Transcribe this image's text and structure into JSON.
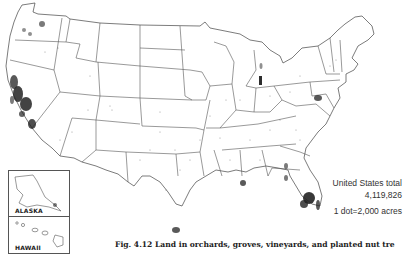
{
  "map": {
    "subject": "Land in orchards, groves, vineyards, and planted nut trees",
    "region": "United States",
    "symbology": "dot-density",
    "dot_color": "#222222",
    "boundary_color": "#555555",
    "background_color": "#ffffff",
    "concentrations": [
      "California Central Valley",
      "Southern California",
      "Washington (Yakima/Wenatchee)",
      "Oregon (Willamette/Hood River)",
      "Western Michigan",
      "Lake Erie shore / New York",
      "Mid-Atlantic (Virginia/Maryland/Pennsylvania)",
      "Georgia",
      "Central Florida",
      "Lower Rio Grande Valley, Texas",
      "Gulf Coast Mississippi/Alabama"
    ]
  },
  "legend": {
    "title": "United States total",
    "total": "4,119,826",
    "scale": "1 dot=2,000 acres"
  },
  "insets": {
    "alaska": {
      "label": "ALASKA"
    },
    "hawaii": {
      "label": "HAWAII"
    }
  },
  "caption": {
    "text": "Fig. 4.12   Land in orchards, groves, vineyards, and planted nut tre"
  }
}
